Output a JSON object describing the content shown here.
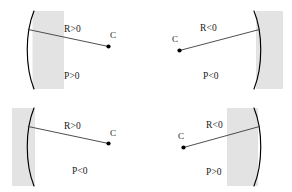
{
  "figure": {
    "colors": {
      "shade": "#e3e3e3",
      "arc": "#000000",
      "radius_line": "#3a3a3a",
      "center_dot": "#000000",
      "text": "#1a1a1a",
      "background": "#ffffff"
    },
    "panels": [
      {
        "id": "top-left",
        "radius_label": "R>0",
        "power_label": "P<0",
        "center_label": "C",
        "arc_bulge": "left",
        "shade_side": "right",
        "center_side": "right"
      },
      {
        "id": "top-right",
        "radius_label": "R<0",
        "power_label": "P<0",
        "center_label": "C",
        "arc_bulge": "right",
        "shade_side": "right",
        "center_side": "left"
      },
      {
        "id": "bottom-left",
        "radius_label": "R>0",
        "power_label": "P<0",
        "center_label": "C",
        "arc_bulge": "left",
        "shade_side": "left",
        "center_side": "right"
      },
      {
        "id": "bottom-right",
        "radius_label": "R<0",
        "power_label": "P>0",
        "center_label": "C",
        "arc_bulge": "right",
        "shade_side": "left",
        "center_side": "left"
      }
    ],
    "labels": {
      "p1_radius": "R>0",
      "p1_power": "P>0",
      "p1_center": "C",
      "p2_radius": "R<0",
      "p2_power": "P<0",
      "p2_center": "C",
      "p3_radius": "R>0",
      "p3_power": "P<0",
      "p3_center": "C",
      "p4_radius": "R<0",
      "p4_power": "P>0",
      "p4_center": "C"
    }
  }
}
